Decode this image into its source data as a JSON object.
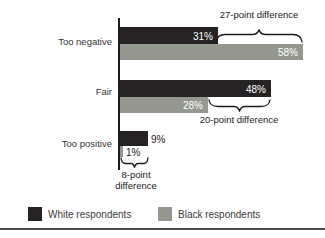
{
  "figure": {
    "background": "#ffffff",
    "bottom_rule_color": "#4b4b53"
  },
  "chart_data": {
    "type": "bar",
    "orientation": "horizontal",
    "unit": "percent",
    "title": "",
    "xlabel": "",
    "ylabel": "",
    "axis_color": "#1e1c1c",
    "categories": [
      "Too negative",
      "Fair",
      "Too positive"
    ],
    "series": [
      {
        "name": "White respondents",
        "color": "#272324",
        "values": [
          31,
          48,
          9
        ],
        "labels": [
          "31%",
          "48%",
          "9%"
        ]
      },
      {
        "name": "Black respondents",
        "color": "#95988f",
        "values": [
          58,
          28,
          1
        ],
        "labels": [
          "58%",
          "28%",
          "1%"
        ]
      }
    ],
    "point_differences": [
      27,
      20,
      8
    ],
    "annotations": [
      {
        "text": "27-point difference",
        "category": "Too negative"
      },
      {
        "text": "20-point difference",
        "category": "Fair"
      },
      {
        "text": "8-point difference",
        "category": "Too positive"
      }
    ],
    "legend_position": "bottom"
  },
  "legend": {
    "items": [
      {
        "label": "White respondents",
        "color": "#272324"
      },
      {
        "label": "Black respondents",
        "color": "#95988f"
      }
    ]
  }
}
